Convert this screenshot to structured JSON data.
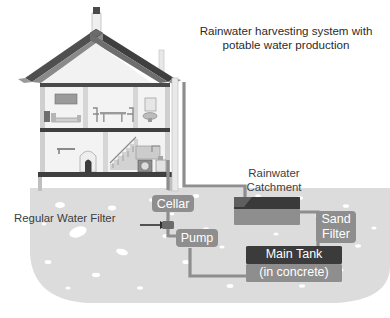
{
  "figure": {
    "title_line1": "Rainwater harvesting system with",
    "title_line2": "potable water production",
    "domain_type": "diagram",
    "palette": {
      "ground": "#d9d9d9",
      "ground_speckle": "#ffffff",
      "pipe": "#8e8e8e",
      "chip_gray": "#8e8e8e",
      "chip_dark": "#3b3b3b",
      "roof_dark": "#4a4a4a",
      "roof_mid": "#7c7c7c",
      "wall_light": "#ededed",
      "wall_mid": "#c9c9c9",
      "floor_dark": "#3f3f3f",
      "text_dark": "#3d3d3d",
      "text_light": "#ffffff",
      "background": "#ffffff"
    }
  },
  "labels": {
    "rainwater_catchment_line1": "Rainwater",
    "rainwater_catchment_line2": "Catchment",
    "regular_water_filter": "Regular Water Filter",
    "cellar": "Cellar",
    "pump": "Pump",
    "sand_filter_line1": "Sand",
    "sand_filter_line2": "Filter",
    "main_tank": "Main Tank",
    "main_tank_sub": "(in concrete)"
  },
  "components": [
    {
      "id": "house",
      "name": "cut-away house section",
      "interactable": false
    },
    {
      "id": "chimney",
      "name": "chimney",
      "interactable": false
    },
    {
      "id": "roof",
      "name": "gable roof",
      "interactable": false
    },
    {
      "id": "upper-floor",
      "name": "upper floor rooms",
      "interactable": false
    },
    {
      "id": "lower-floor",
      "name": "lower floor rooms",
      "interactable": false
    },
    {
      "id": "downpipe",
      "name": "roof downpipe",
      "interactable": false
    },
    {
      "id": "cellar-box",
      "name": "Cellar",
      "interactable": true
    },
    {
      "id": "regular-water-filter-node",
      "name": "Regular Water Filter",
      "interactable": true
    },
    {
      "id": "pump-box",
      "name": "Pump",
      "interactable": true
    },
    {
      "id": "catchment-tank",
      "name": "Rainwater Catchment",
      "interactable": true
    },
    {
      "id": "sand-filter-box",
      "name": "Sand Filter",
      "interactable": true
    },
    {
      "id": "main-tank-box",
      "name": "Main Tank (in concrete)",
      "interactable": true
    },
    {
      "id": "ground",
      "name": "underground soil region",
      "interactable": false
    }
  ]
}
